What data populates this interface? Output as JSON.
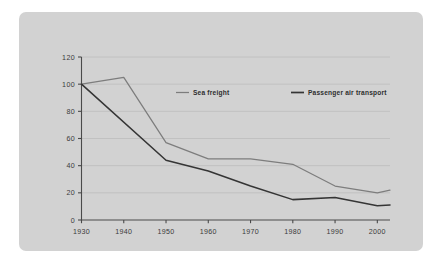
{
  "panel": {
    "background_color": "#d2d2d2",
    "page_background_color": "#ffffff"
  },
  "chart_data": {
    "type": "line",
    "title": "",
    "subtitle": "",
    "xlabel": "",
    "ylabel": "",
    "xlim": [
      1930,
      2003
    ],
    "ylim": [
      0,
      120
    ],
    "grid": true,
    "legend_position": "inside-top",
    "x_tick_labels": [
      "1930",
      "1940",
      "1950",
      "1960",
      "1970",
      "1980",
      "1990",
      "2000"
    ],
    "x_ticks": [
      1930,
      1940,
      1950,
      1960,
      1970,
      1980,
      1990,
      2000
    ],
    "y_tick_labels": [
      "0",
      "20",
      "40",
      "60",
      "80",
      "100",
      "120"
    ],
    "y_ticks": [
      0,
      20,
      40,
      60,
      80,
      100,
      120
    ],
    "series": [
      {
        "name": "Sea freight",
        "color": "#7d7d7d",
        "stroke_width": 1.25,
        "x": [
          1930,
          1940,
          1950,
          1960,
          1970,
          1980,
          1990,
          2000,
          2003
        ],
        "values": [
          100,
          105,
          57,
          45,
          45,
          41,
          25,
          20,
          22
        ]
      },
      {
        "name": "Passenger air transport",
        "color": "#353535",
        "stroke_width": 1.55,
        "x": [
          1930,
          1950,
          1960,
          1970,
          1980,
          1990,
          2000,
          2003
        ],
        "values": [
          100,
          44,
          36,
          25,
          15,
          16.5,
          10.5,
          11
        ]
      }
    ]
  },
  "legend": {
    "items": [
      {
        "label": "Sea freight",
        "color": "#7d7d7d"
      },
      {
        "label": "Passenger air transport",
        "color": "#353535"
      }
    ]
  }
}
